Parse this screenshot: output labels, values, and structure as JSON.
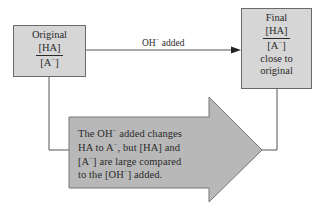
{
  "original_box": {
    "title": "Original",
    "numerator": "[HA]",
    "denominator_prefix": "[A",
    "denominator_sup": "−",
    "denominator_suffix": "]"
  },
  "transition": {
    "label_prefix": "OH",
    "label_sup": "−",
    "label_suffix": " added"
  },
  "final_box": {
    "title": "Final",
    "numerator": "[HA]",
    "denominator_prefix": "[A",
    "denominator_sup": "−",
    "denominator_suffix": "]",
    "note_line1": "close to",
    "note_line2": "original"
  },
  "explanation_arrow": {
    "line1_a": "The OH",
    "line1_sup": "−",
    "line1_b": " added changes",
    "line2_a": "HA to A",
    "line2_sup": "−",
    "line2_b": ", but [HA] and",
    "line3_a": "[A",
    "line3_sup": "−",
    "line3_b": "] are large compared",
    "line4_a": "to the [OH",
    "line4_sup": "−",
    "line4_b": "] added."
  },
  "colors": {
    "box_fill": "#d6d6d6",
    "arrow_fill": "#b8b8b8",
    "line": "#555555",
    "text": "#2a2a2a"
  }
}
